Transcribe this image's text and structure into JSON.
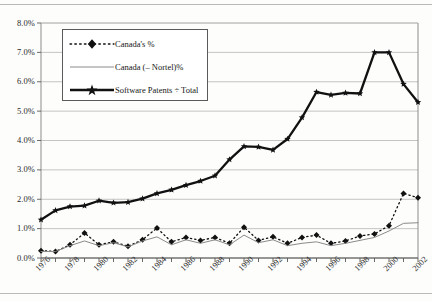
{
  "chart_data": {
    "type": "line",
    "title": "",
    "subtitle": "",
    "xlabel": "",
    "ylabel": "",
    "xlim": [
      1976,
      2002
    ],
    "ylim": [
      0.0,
      8.0
    ],
    "y_tick_labels": [
      "0.0%",
      "1.0%",
      "2.0%",
      "3.0%",
      "4.0%",
      "5.0%",
      "6.0%",
      "7.0%",
      "8.0%"
    ],
    "y_tick_values": [
      0.0,
      1.0,
      2.0,
      3.0,
      4.0,
      5.0,
      6.0,
      7.0,
      8.0
    ],
    "x_tick_labels": [
      "1976",
      "1978",
      "1980",
      "1982",
      "1984",
      "1986",
      "1988",
      "1990",
      "1992",
      "1994",
      "1996",
      "1998",
      "2000",
      "2002"
    ],
    "x_tick_values": [
      1976,
      1978,
      1980,
      1982,
      1984,
      1986,
      1988,
      1990,
      1992,
      1994,
      1996,
      1998,
      2000,
      2002
    ],
    "x": [
      1976,
      1977,
      1978,
      1979,
      1980,
      1981,
      1982,
      1983,
      1984,
      1985,
      1986,
      1987,
      1988,
      1989,
      1990,
      1991,
      1992,
      1993,
      1994,
      1995,
      1996,
      1997,
      1998,
      1999,
      2000,
      2001,
      2002
    ],
    "grid": "horizontal",
    "legend_position": "upper-left-inside",
    "series": [
      {
        "name": "Canada's %",
        "style": "dotted",
        "marker": "diamond",
        "color": "#111111",
        "values": [
          0.25,
          0.22,
          0.45,
          0.85,
          0.45,
          0.55,
          0.4,
          0.62,
          1.02,
          0.55,
          0.7,
          0.6,
          0.7,
          0.5,
          1.05,
          0.6,
          0.72,
          0.5,
          0.7,
          0.78,
          0.5,
          0.58,
          0.75,
          0.82,
          1.1,
          2.2,
          2.05
        ]
      },
      {
        "name": "Canada (– Nortel)%",
        "style": "solid-thin",
        "marker": "none",
        "color": "#8a8a8a",
        "values": [
          0.22,
          0.22,
          0.42,
          0.58,
          0.42,
          0.52,
          0.38,
          0.58,
          0.72,
          0.45,
          0.62,
          0.5,
          0.62,
          0.45,
          0.78,
          0.52,
          0.62,
          0.42,
          0.5,
          0.55,
          0.42,
          0.5,
          0.6,
          0.7,
          0.92,
          1.18,
          1.2
        ]
      },
      {
        "name": "Software Patents ÷ Total",
        "style": "solid-thick",
        "marker": "star",
        "color": "#111111",
        "values": [
          1.3,
          1.62,
          1.75,
          1.78,
          1.95,
          1.88,
          1.9,
          2.02,
          2.2,
          2.32,
          2.48,
          2.62,
          2.8,
          3.35,
          3.8,
          3.78,
          3.68,
          4.05,
          4.78,
          5.65,
          5.55,
          5.62,
          5.6,
          7.0,
          7.0,
          5.92,
          5.3
        ]
      }
    ]
  },
  "legend": {
    "items": [
      {
        "label": "Canada's %"
      },
      {
        "label": "Canada (– Nortel)%"
      },
      {
        "label": "Software Patents ÷ Total"
      }
    ]
  }
}
